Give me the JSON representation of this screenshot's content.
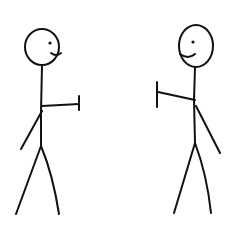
{
  "image": {
    "description": "Two hand-drawn stick figures facing each other, each extending one arm toward the other",
    "background": "#ffffff",
    "ink_color": "#111111"
  },
  "figures": [
    {
      "name": "left-stick-figure",
      "facing": "right",
      "expression": "smile"
    },
    {
      "name": "right-stick-figure",
      "facing": "left",
      "expression": "smile"
    }
  ]
}
